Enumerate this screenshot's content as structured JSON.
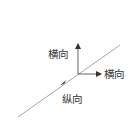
{
  "diagram": {
    "labels": {
      "transverse_vertical": "横向",
      "transverse_horizontal": "横向",
      "longitudinal": "纵向"
    },
    "colors": {
      "line": "#9a9a9a",
      "arrow": "#333333",
      "text": "#333333"
    }
  }
}
